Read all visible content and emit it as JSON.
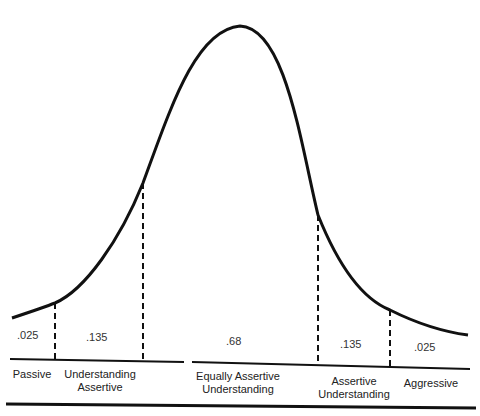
{
  "diagram": {
    "type": "normal-distribution-curve",
    "regions": [
      {
        "value": ".025",
        "label_lines": [
          "Passive"
        ]
      },
      {
        "value": ".135",
        "label_lines": [
          "Understanding",
          "Assertive"
        ]
      },
      {
        "value": ".68",
        "label_lines": [
          "Equally Assertive",
          "Understanding"
        ]
      },
      {
        "value": ".135",
        "label_lines": [
          "Assertive",
          "Understanding"
        ]
      },
      {
        "value": ".025",
        "label_lines": [
          "Aggressive"
        ]
      }
    ]
  }
}
